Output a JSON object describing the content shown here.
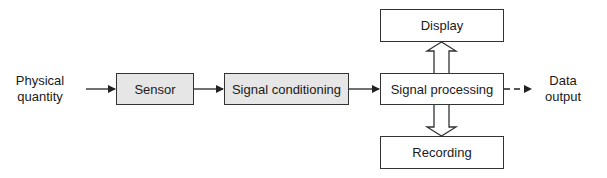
{
  "diagram": {
    "input_label": [
      "Physical",
      "quantity"
    ],
    "blocks": {
      "sensor": "Sensor",
      "conditioning": "Signal conditioning",
      "processing": "Signal processing",
      "display": "Display",
      "recording": "Recording"
    },
    "output_label": [
      "Data",
      "output"
    ],
    "colors": {
      "shaded_block": "#e6e6e6",
      "plain_block": "#ffffff",
      "line": "#333333"
    }
  }
}
